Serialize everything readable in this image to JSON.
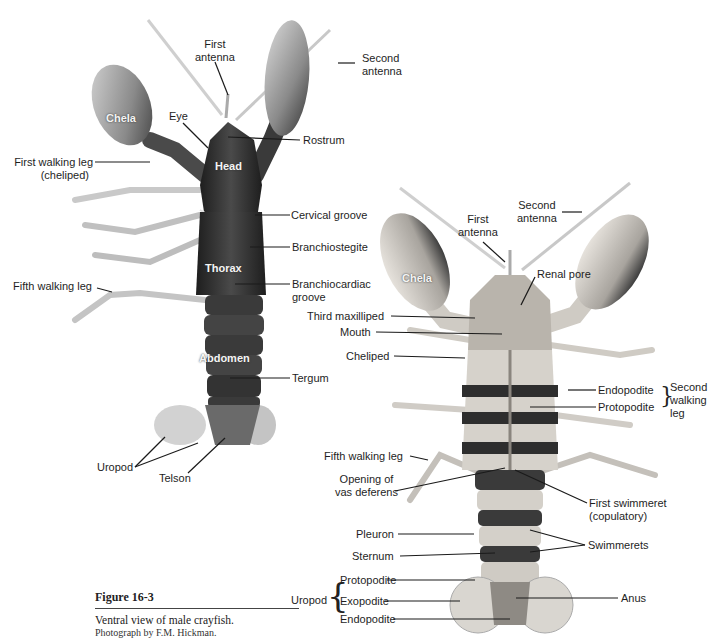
{
  "figure": {
    "number": "Figure 16-3",
    "description": "Ventral view of male crayfish.",
    "credit": "Photograph by F.M. Hickman."
  },
  "dorsal_view": {
    "body_labels": {
      "chela": "Chela",
      "head": "Head",
      "thorax": "Thorax",
      "abdomen": "Abdomen"
    },
    "labels": {
      "first_antenna": [
        "First",
        "antenna"
      ],
      "second_antenna": [
        "Second",
        "antenna"
      ],
      "eye": "Eye",
      "rostrum": "Rostrum",
      "first_walking_leg": [
        "First walking leg",
        "(cheliped)"
      ],
      "cervical_groove": "Cervical groove",
      "branchiostegite": "Branchiostegite",
      "branchiocardiac_groove": [
        "Branchiocardiac",
        "groove"
      ],
      "fifth_walking_leg": "Fifth walking leg",
      "tergum": "Tergum",
      "uropod": "Uropod",
      "telson": "Telson"
    }
  },
  "ventral_view": {
    "body_labels": {
      "chela": "Chela"
    },
    "labels": {
      "first_antenna": [
        "First",
        "antenna"
      ],
      "second_antenna": [
        "Second",
        "antenna"
      ],
      "renal_pore": "Renal pore",
      "third_maxilliped": "Third maxilliped",
      "mouth": "Mouth",
      "cheliped": "Cheliped",
      "endopodite": "Endopodite",
      "protopodite": "Protopodite",
      "second_walking_leg": [
        "Second",
        "walking",
        "leg"
      ],
      "fifth_walking_leg": "Fifth walking leg",
      "opening_vas_deferens": [
        "Opening of",
        "vas deferens"
      ],
      "first_swimmeret": [
        "First swimmeret",
        "(copulatory)"
      ],
      "pleuron": "Pleuron",
      "sternum": "Sternum",
      "swimmerets": "Swimmerets",
      "uropod": "Uropod",
      "uropod_protopodite": "Protopodite",
      "uropod_exopodite": "Exopodite",
      "uropod_endopodite": "Endopodite",
      "anus": "Anus"
    }
  },
  "colors": {
    "background": "#ffffff",
    "dorsal_shell": "#2a2a2a",
    "ventral_shell": "#d9d6d0",
    "band_dark": "#3a3a3a",
    "leader_line": "#1a1a1a"
  }
}
